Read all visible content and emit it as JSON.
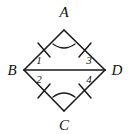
{
  "figure": {
    "kind": "geometry-diagram",
    "shape_name": "rhombus",
    "background_color": "#ffffff",
    "line_color": "#1a1a1a",
    "text_color": "#121212",
    "width": 129,
    "height": 134,
    "vertices": [
      {
        "id": "A",
        "label": "A",
        "x": 64,
        "y": 30,
        "label_x": 64,
        "label_y": 17
      },
      {
        "id": "B",
        "label": "B",
        "x": 24,
        "y": 70,
        "label_x": 12,
        "label_y": 75
      },
      {
        "id": "C",
        "label": "C",
        "x": 64,
        "y": 111,
        "label_x": 64,
        "label_y": 130
      },
      {
        "id": "D",
        "label": "D",
        "x": 105,
        "y": 70,
        "label_x": 117,
        "label_y": 75
      }
    ],
    "edges": [
      {
        "id": "AB",
        "from": "A",
        "to": "B",
        "tick_marks": 1
      },
      {
        "id": "AD",
        "from": "A",
        "to": "D",
        "tick_marks": 1
      },
      {
        "id": "BC",
        "from": "B",
        "to": "C",
        "tick_marks": 1
      },
      {
        "id": "CD",
        "from": "C",
        "to": "D",
        "tick_marks": 1
      }
    ],
    "diagonals": [
      {
        "id": "BD",
        "from": "B",
        "to": "D"
      }
    ],
    "angle_labels": [
      {
        "id": "angle-1",
        "label": "1",
        "x": 39,
        "y": 64,
        "at_vertex": "B",
        "position": "upper"
      },
      {
        "id": "angle-2",
        "label": "2",
        "x": 39,
        "y": 83,
        "at_vertex": "B",
        "position": "lower"
      },
      {
        "id": "angle-3",
        "label": "3",
        "x": 89,
        "y": 64,
        "at_vertex": "D",
        "position": "upper"
      },
      {
        "id": "angle-4",
        "label": "4",
        "x": 89,
        "y": 83,
        "at_vertex": "D",
        "position": "lower"
      }
    ],
    "angle_arcs": [
      {
        "id": "arc-A",
        "at_vertex": "A",
        "path": "M 53 44 Q 64 52 75 44"
      },
      {
        "id": "arc-C",
        "at_vertex": "C",
        "path": "M 53 97 Q 64 89 75 97"
      }
    ],
    "tick_segments": [
      {
        "id": "tick-AB",
        "on_edge": "AB",
        "x1": 38,
        "y1": 43,
        "x2": 50,
        "y2": 57
      },
      {
        "id": "tick-AD",
        "on_edge": "AD",
        "x1": 91,
        "y1": 43,
        "x2": 79,
        "y2": 57
      },
      {
        "id": "tick-BC",
        "on_edge": "BC",
        "x1": 38,
        "y1": 98,
        "x2": 50,
        "y2": 84
      },
      {
        "id": "tick-CD",
        "on_edge": "CD",
        "x1": 91,
        "y1": 98,
        "x2": 79,
        "y2": 84
      }
    ]
  }
}
